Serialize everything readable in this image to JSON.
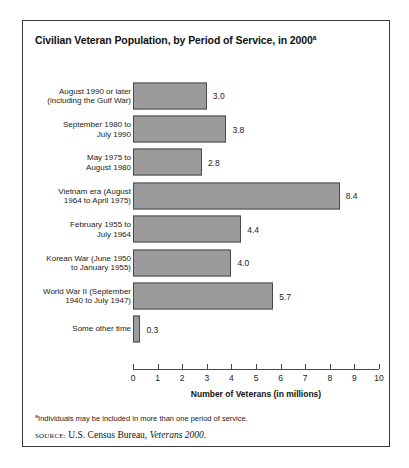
{
  "figure": {
    "title": "Civilian Veteran Population, by Period of Service, in 2000",
    "title_superscript": "a",
    "footnote_marker": "a",
    "footnote_text": "Individuals may be included in more than one period of service.",
    "source_label": "SOURCE:",
    "source_text_before": " U.S. Census Bureau, ",
    "source_italic": "Veterans 2000",
    "source_text_after": "."
  },
  "chart_data": {
    "type": "bar",
    "orientation": "horizontal",
    "title": "Civilian Veteran Population, by Period of Service, in 2000",
    "xlabel": "Number of Veterans (in millions)",
    "ylabel": "",
    "xlim": [
      0,
      10
    ],
    "xticks": [
      0,
      1,
      2,
      3,
      4,
      5,
      6,
      7,
      8,
      9,
      10
    ],
    "xtick_labels": [
      "0",
      "1",
      "2",
      "3",
      "4",
      "5",
      "6",
      "7",
      "8",
      "9",
      "10"
    ],
    "grid": false,
    "legend": false,
    "bar_color": "#9b9b9b",
    "bar_edge_color": "#4a4a4a",
    "categories": [
      "August 1990 or later\n(including the Gulf War)",
      "September 1980 to\nJuly 1990",
      "May 1975 to\nAugust 1980",
      "Vietnam era (August\n1964 to April 1975)",
      "February 1955 to\nJuly 1964",
      "Korean War (June 1950\nto January 1955)",
      "World War II (September\n1940 to July 1947)",
      "Some other time"
    ],
    "values": [
      3.0,
      3.8,
      2.8,
      8.4,
      4.4,
      4.0,
      5.7,
      0.3
    ],
    "value_labels": [
      "3.0",
      "3.8",
      "2.8",
      "8.4",
      "4.4",
      "4.0",
      "5.7",
      "0.3"
    ]
  }
}
